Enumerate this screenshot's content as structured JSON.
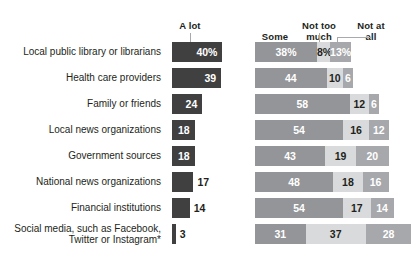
{
  "chart_data": {
    "type": "bar",
    "subtype": "paired-horizontal-bar-and-stacked-bar",
    "title": "",
    "xlabel": "",
    "ylabel": "",
    "units": "%",
    "note": "First row values carry a % sign; remaining rows show bare numbers.",
    "legend_position": "top",
    "grid": false,
    "xlim": [
      0,
      100
    ],
    "categories": [
      "Local public library or librarians",
      "Health care providers",
      "Family or friends",
      "Local news organizations",
      "Government sources",
      "National news organizations",
      "Financial institutions",
      "Social media, such as Facebook,\nTwitter or Instagram*"
    ],
    "series": [
      {
        "name": "A lot",
        "values": [
          40,
          39,
          24,
          18,
          18,
          17,
          14,
          3
        ]
      },
      {
        "name": "Some",
        "values": [
          38,
          44,
          58,
          54,
          43,
          48,
          54,
          31
        ]
      },
      {
        "name": "Not too much",
        "values": [
          8,
          10,
          12,
          16,
          19,
          18,
          17,
          37
        ]
      },
      {
        "name": "Not at all",
        "values": [
          13,
          6,
          6,
          12,
          20,
          16,
          14,
          28
        ]
      }
    ],
    "value_labels": {
      "a_lot": [
        "40%",
        "39",
        "24",
        "18",
        "18",
        "17",
        "14",
        "3"
      ],
      "some": [
        "38%",
        "44",
        "58",
        "54",
        "43",
        "48",
        "54",
        "31"
      ],
      "not_too_much": [
        "8%",
        "10",
        "12",
        "16",
        "19",
        "18",
        "17",
        "37"
      ],
      "not_at_all": [
        "13%",
        "6",
        "6",
        "12",
        "20",
        "16",
        "14",
        "28"
      ]
    },
    "colors": {
      "a_lot": "#404041",
      "some": "#939598",
      "not_too_much": "#d9dadb",
      "not_at_all": "#a6a8ab",
      "leader_line": "#a7a9ac",
      "text": "#231f20",
      "background": "#ffffff"
    }
  },
  "headers": {
    "a_lot": "A lot",
    "some": "Some",
    "not_too_much": "Not too\nmuch",
    "not_at_all": "Not at\nall"
  },
  "rows": [
    {
      "label": "Local public library or librarians",
      "a_lot": 40,
      "a_lot_label": "40%",
      "some": 38,
      "some_label": "38%",
      "not_too_much": 8,
      "not_too_much_label": "8%",
      "not_at_all": 13,
      "not_at_all_label": "13%"
    },
    {
      "label": "Health care providers",
      "a_lot": 39,
      "a_lot_label": "39",
      "some": 44,
      "some_label": "44",
      "not_too_much": 10,
      "not_too_much_label": "10",
      "not_at_all": 6,
      "not_at_all_label": "6"
    },
    {
      "label": "Family or friends",
      "a_lot": 24,
      "a_lot_label": "24",
      "some": 58,
      "some_label": "58",
      "not_too_much": 12,
      "not_too_much_label": "12",
      "not_at_all": 6,
      "not_at_all_label": "6"
    },
    {
      "label": "Local news organizations",
      "a_lot": 18,
      "a_lot_label": "18",
      "some": 54,
      "some_label": "54",
      "not_too_much": 16,
      "not_too_much_label": "16",
      "not_at_all": 12,
      "not_at_all_label": "12"
    },
    {
      "label": "Government sources",
      "a_lot": 18,
      "a_lot_label": "18",
      "some": 43,
      "some_label": "43",
      "not_too_much": 19,
      "not_too_much_label": "19",
      "not_at_all": 20,
      "not_at_all_label": "20"
    },
    {
      "label": "National news organizations",
      "a_lot": 17,
      "a_lot_label": "17",
      "some": 48,
      "some_label": "48",
      "not_too_much": 18,
      "not_too_much_label": "18",
      "not_at_all": 16,
      "not_at_all_label": "16"
    },
    {
      "label": "Financial institutions",
      "a_lot": 14,
      "a_lot_label": "14",
      "some": 54,
      "some_label": "54",
      "not_too_much": 17,
      "not_too_much_label": "17",
      "not_at_all": 14,
      "not_at_all_label": "14"
    },
    {
      "label": "Social media, such as Facebook,\nTwitter or Instagram*",
      "a_lot": 3,
      "a_lot_label": "3",
      "some": 31,
      "some_label": "31",
      "not_too_much": 37,
      "not_too_much_label": "37",
      "not_at_all": 28,
      "not_at_all_label": "28"
    }
  ]
}
